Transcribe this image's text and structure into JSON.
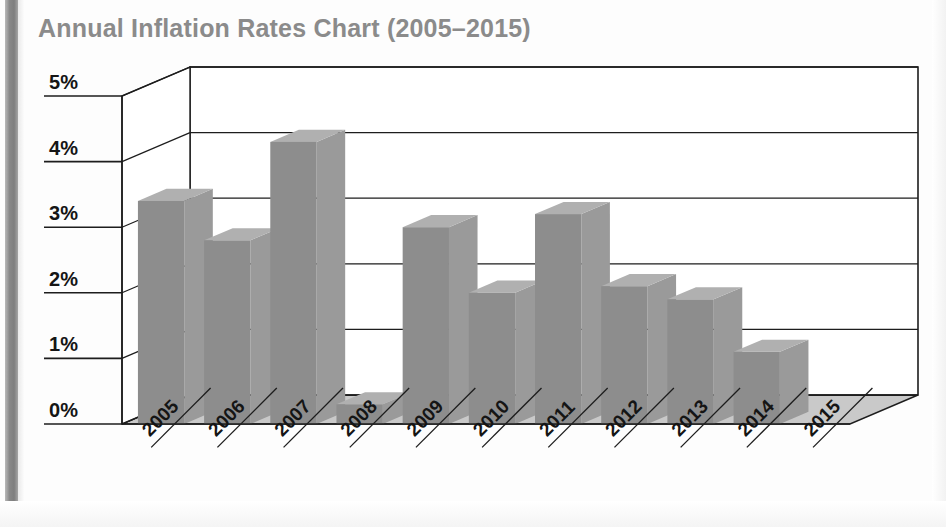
{
  "title": "Annual Inflation Rates Chart (2005–2015)",
  "colors": {
    "title": "#8b8b8b",
    "bar_front": "#8d8d8d",
    "bar_top": "#b0b0b0",
    "bar_side": "#9a9a9a",
    "floor": "#c9c9c9",
    "floor_shadow": "#a8a8a8",
    "axis_line": "#1d1d1d",
    "page": "#ffffff",
    "binding": "#808080"
  },
  "axis": {
    "y_ticks": [
      "0%",
      "1%",
      "2%",
      "3%",
      "4%",
      "5%"
    ],
    "y_values": [
      0,
      1,
      2,
      3,
      4,
      5
    ],
    "y_min": 0,
    "y_max": 5,
    "x_ticks": [
      "2005",
      "2006",
      "2007",
      "2008",
      "2009",
      "2010",
      "2011",
      "2012",
      "2013",
      "2014",
      "2015"
    ]
  },
  "chart_data": {
    "type": "bar",
    "title": "Annual Inflation Rates Chart (2005–2015)",
    "xlabel": "",
    "ylabel": "",
    "ylim": [
      0,
      5
    ],
    "grid": true,
    "legend": "none",
    "style": "3d-column",
    "categories": [
      "2005",
      "2006",
      "2007",
      "2008",
      "2009",
      "2010",
      "2011",
      "2012",
      "2013",
      "2014",
      "2015"
    ],
    "values": [
      3.4,
      2.8,
      4.3,
      0.3,
      3.0,
      2.0,
      3.2,
      2.1,
      1.9,
      1.1,
      0.0
    ],
    "value_unit": "%",
    "series": [
      {
        "name": "Annual Inflation Rate",
        "values": [
          3.4,
          2.8,
          4.3,
          0.3,
          3.0,
          2.0,
          3.2,
          2.1,
          1.9,
          1.1,
          0.0
        ]
      }
    ]
  }
}
